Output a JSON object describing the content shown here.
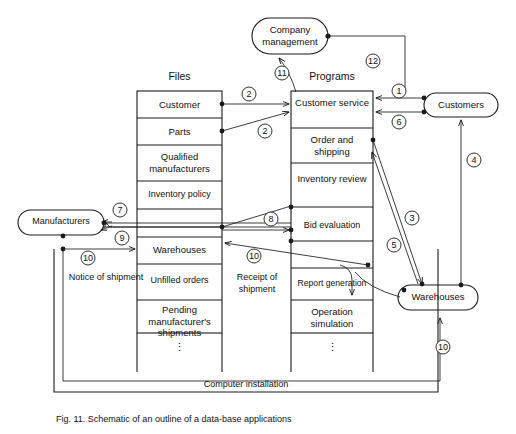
{
  "figure": {
    "caption": "Fig. 11.  Schematic of an outline of a data-base applications",
    "outer_box_label": "Computer installation"
  },
  "columns": {
    "files_header": "Files",
    "programs_header": "Programs"
  },
  "files": {
    "rows": [
      {
        "label": "Customer"
      },
      {
        "label": "Parts"
      },
      {
        "label": "Qualified manufacturers"
      },
      {
        "label": "Inventory policy"
      },
      {
        "label": "Warehouses"
      },
      {
        "label": "Unfilled orders"
      },
      {
        "label": "Pending manufacturer's shipments"
      },
      {
        "label": "⋮"
      }
    ]
  },
  "programs": {
    "rows": [
      {
        "label": "Customer service"
      },
      {
        "label": "Order and shipping"
      },
      {
        "label": "Inventory review"
      },
      {
        "label": "Bid evaluation"
      },
      {
        "label": "Report generation"
      },
      {
        "label": "Operation simulation"
      },
      {
        "label": "⋮"
      }
    ]
  },
  "entities": {
    "company_management": "Company management",
    "customers": "Customers",
    "manufacturers": "Manufacturers",
    "warehouses": "Warehouses"
  },
  "flow_labels": {
    "notice_of_shipment": "Notice of shipment",
    "receipt_of_shipment": "Receipt of shipment"
  },
  "arrow_numbers": {
    "n1": "1",
    "n2a": "2",
    "n2b": "2",
    "n3": "3",
    "n4": "4",
    "n5": "5",
    "n6": "6",
    "n7": "7",
    "n8": "8",
    "n9": "9",
    "n10a": "10",
    "n10b": "10",
    "n10c": "10",
    "n11": "11",
    "n12": "12"
  },
  "colors": {
    "stroke": "#1a1a1a",
    "background": "#ffffff",
    "text": "#111111"
  }
}
